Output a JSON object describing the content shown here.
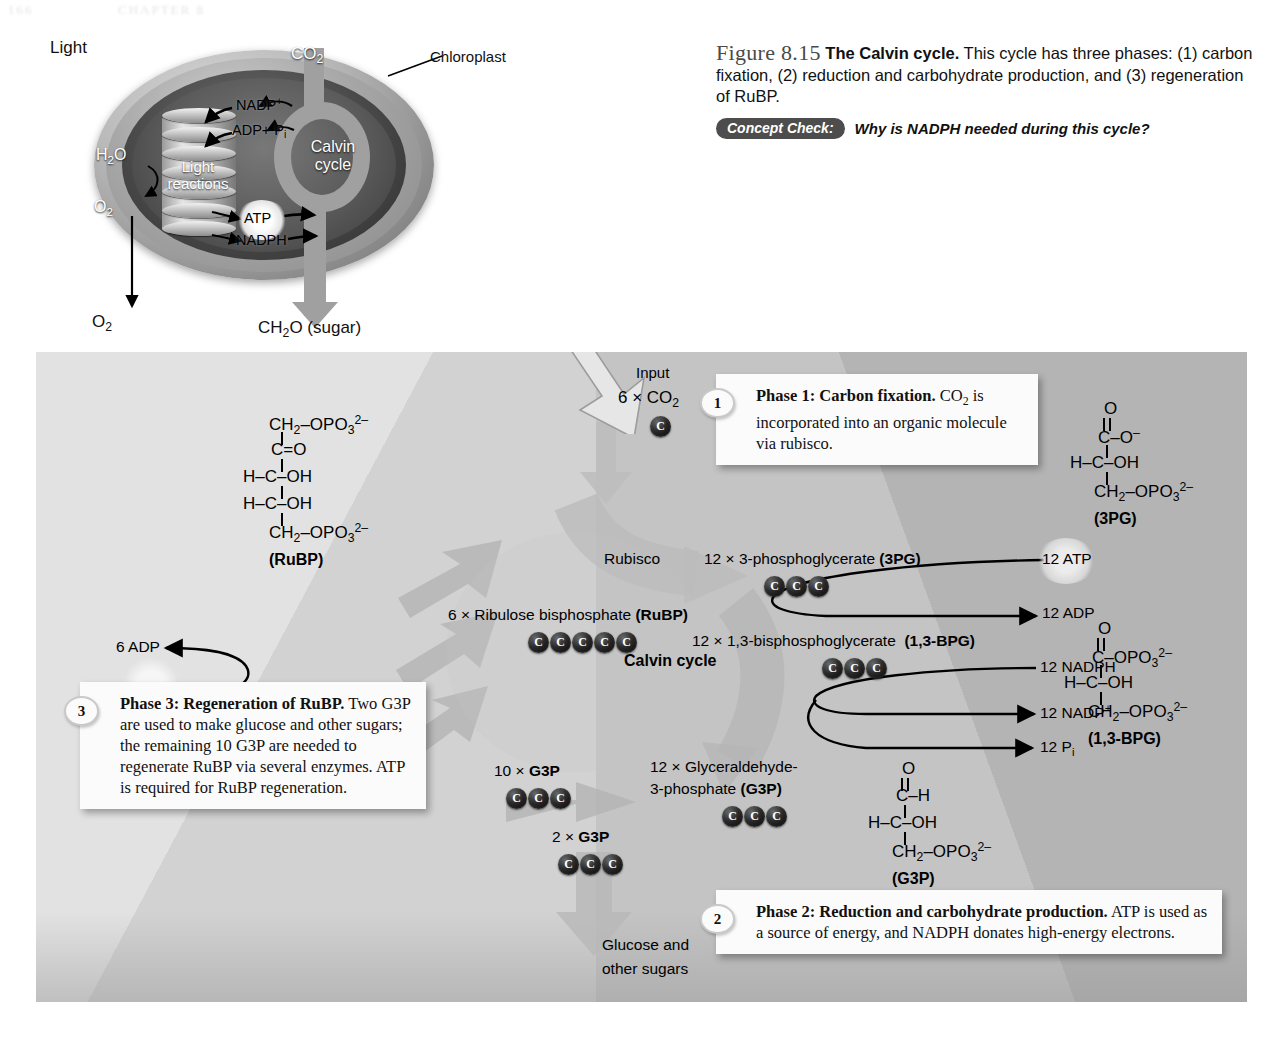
{
  "page_header": {
    "page_number": "166",
    "chapter": "CHAPTER 8"
  },
  "caption": {
    "figure_number": "Figure 8.15",
    "figure_title": "The Calvin cycle.",
    "text": "This cycle has three phases: (1) carbon fixation, (2) reduction and carbohydrate production, and (3) regeneration of RuBP.",
    "concept_check_tag": "Concept Check:",
    "concept_check_question": "Why is NADPH needed during this cycle?"
  },
  "chloroplast": {
    "light": "Light",
    "co2": "CO2",
    "chloroplast_label": "Chloroplast",
    "nadp_plus": "NADP+",
    "adp_pi": "ADP+ Pi",
    "h2o": "H2O",
    "o2_inner": "O2",
    "o2_outer": "O2",
    "light_reactions": "Light reactions",
    "calvin_cycle": "Calvin cycle",
    "atp": "ATP",
    "nadph": "NADPH",
    "output": "CH2O (sugar)"
  },
  "panel": {
    "input_label": "Input",
    "input_molecule": "6 × CO2",
    "input_carbons": 1,
    "rubisco_label": "Rubisco",
    "calvin_cycle_label": "Calvin cycle",
    "pg3": {
      "count": "12 ×",
      "name": "3-phosphoglycerate",
      "abbr": "(3PG)",
      "carbons": 3
    },
    "rubp": {
      "count": "6 ×",
      "name": "Ribulose bisphosphate",
      "abbr": "(RuBP)",
      "carbons": 5
    },
    "bpg13": {
      "count": "12 ×",
      "name": "1,3-bisphosphoglycerate",
      "abbr": "(1,3-BPG)",
      "carbons": 3
    },
    "g3p_main": {
      "count": "12 ×",
      "name_line1": "Glyceraldehyde-",
      "name_line2": "3-phosphate",
      "abbr": "(G3P)",
      "carbons": 3
    },
    "g3p_ten": {
      "label": "10 ×",
      "abbr": "G3P",
      "carbons": 3
    },
    "g3p_two": {
      "label": "2 ×",
      "abbr": "G3P",
      "carbons": 3
    },
    "atp12": "12 ATP",
    "adp12": "12 ADP",
    "nadph12": "12 NADPH",
    "nadp12": "12 NADP+",
    "pi12": "12 Pi",
    "adp6": "6 ADP",
    "atp6": "6 ATP",
    "output_line1": "Glucose and",
    "output_line2": "other sugars"
  },
  "callouts": [
    {
      "number": "1",
      "title": "Phase 1: Carbon fixation.",
      "body": "CO2 is incorporated into an organic molecule via rubisco."
    },
    {
      "number": "2",
      "title": "Phase 2: Reduction and carbohydrate production.",
      "body": "ATP is used as a source of energy, and NADPH donates high-energy electrons."
    },
    {
      "number": "3",
      "title": "Phase 3: Regeneration of RuBP.",
      "body": "Two G3P are used to make glucose and other sugars; the remaining 10 G3P are needed to regenerate RuBP via several enzymes. ATP is required for RuBP regeneration."
    }
  ],
  "structures": {
    "rubp": {
      "name": "(RuBP)",
      "lines": [
        "CH2-OPO3 2-",
        "C=O",
        "H-C-OH",
        "H-C-OH",
        "CH2-OPO3 2-"
      ]
    },
    "pg3": {
      "name": "(3PG)",
      "lines": [
        "O",
        "C-O -",
        "H-C-OH",
        "CH2-OPO3 2-"
      ]
    },
    "bpg13": {
      "name": "(1,3-BPG)",
      "lines": [
        "O",
        "C-OPO3 2-",
        "H-C-OH",
        "CH2-OPO3 2-"
      ]
    },
    "g3p": {
      "name": "(G3P)",
      "lines": [
        "O",
        "C-H",
        "H-C-OH",
        "CH2-OPO3 2-"
      ]
    }
  },
  "colors": {
    "panel_bg": "#cfcfcf",
    "panel_light": "#e2e2e2",
    "panel_dark": "#b4b4b4",
    "arrow_gray": "#b0b0b0",
    "carbon_bead": "#111111",
    "callout_bg": "#fbfbfb",
    "concept_tag_bg": "#4d4d4d"
  }
}
